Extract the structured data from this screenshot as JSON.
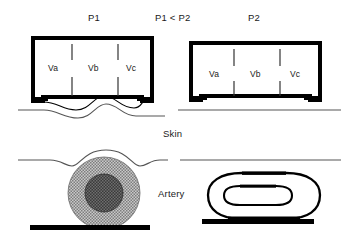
{
  "figure": {
    "title_labels": {
      "left_pressure": "P1",
      "comparison": "P1 < P2",
      "right_pressure": "P2"
    },
    "annotations": {
      "skin": "Skin",
      "artery": "Artery"
    },
    "colors": {
      "ink": "#000000",
      "text": "#1a1a1a",
      "skin_line": "#555555",
      "artery_outer_fill": "#a9a9a9",
      "artery_inner_fill": "#4a4a4a",
      "bone_bar": "#000000",
      "cuff_border": "#000000",
      "divider": "#333333"
    },
    "panels": [
      {
        "id": "left-panel",
        "pressure_label": "P1",
        "cuff": {
          "name": "cuff-low-pressure",
          "compartments": [
            {
              "id": "va",
              "label": "Va"
            },
            {
              "id": "vb",
              "label": "Vb"
            },
            {
              "id": "vc",
              "label": "Vc"
            }
          ]
        },
        "skin_state": "bulged",
        "artery_state": "round-open"
      },
      {
        "id": "right-panel",
        "pressure_label": "P2",
        "cuff": {
          "name": "cuff-high-pressure",
          "compartments": [
            {
              "id": "va",
              "label": "Va"
            },
            {
              "id": "vb",
              "label": "Vb"
            },
            {
              "id": "vc",
              "label": "Vc"
            }
          ]
        },
        "skin_state": "flat",
        "artery_state": "flattened-compressed"
      }
    ]
  }
}
